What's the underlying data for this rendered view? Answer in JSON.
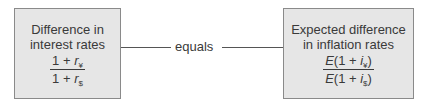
{
  "left_box": {
    "title_line1": "Difference in",
    "title_line2": "interest rates",
    "numerator": {
      "prefix": "1 + ",
      "var": "r",
      "sub": "¥"
    },
    "denominator": {
      "prefix": "1 + ",
      "var": "r",
      "sub": "$"
    }
  },
  "connector": {
    "label": "equals"
  },
  "right_box": {
    "title_line1": "Expected difference",
    "title_line2": "in inflation rates",
    "numerator": {
      "E": "E",
      "prefix": "(1 + ",
      "var": "i",
      "sub": "¥",
      "suffix": ")"
    },
    "denominator": {
      "E": "E",
      "prefix": "(1 + ",
      "var": "i",
      "sub": "$",
      "suffix": ")"
    }
  }
}
